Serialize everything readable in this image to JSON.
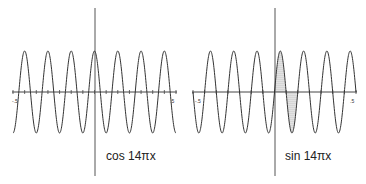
{
  "chart_data": [
    {
      "type": "line",
      "title": "cos 14πx",
      "function": "cos(14*pi*x)",
      "xlim": [
        -0.5,
        0.5
      ],
      "ylim": [
        -1,
        1
      ],
      "x_tick_labels": [
        "-.5",
        ".5"
      ],
      "periods_visible": 7,
      "shaded_region": null
    },
    {
      "type": "line",
      "title": "sin 14πx",
      "function": "sin(14*pi*x)",
      "xlim": [
        -0.5,
        0.5
      ],
      "ylim": [
        -1,
        1
      ],
      "x_tick_labels": [
        "-.5",
        ".5"
      ],
      "periods_visible": 7,
      "shaded_region": {
        "x_from": 0,
        "x_to": 0.142857,
        "fill": "dotted"
      }
    }
  ],
  "plots": {
    "left": {
      "label": "cos 14πx",
      "tick_min": "-.5",
      "tick_max": ".5"
    },
    "right": {
      "label": "sin 14πx",
      "tick_min": "-.5",
      "tick_max": ".5"
    }
  },
  "colors": {
    "curve": "#333333",
    "axis": "#444444",
    "shade": "#888888"
  }
}
